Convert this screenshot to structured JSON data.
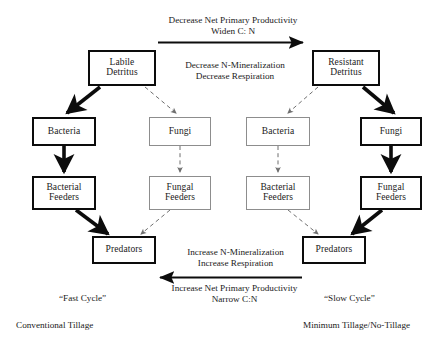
{
  "diagram": {
    "colors": {
      "thick_stroke": "#0c0c0c",
      "thin_stroke": "#8d8d8d",
      "background": "#ffffff",
      "text": "#1a1a1a"
    },
    "nodes": {
      "labile_detritus": "Labile\nDetritus",
      "labile_detritus_l1": "Labile",
      "labile_detritus_l2": "Detritus",
      "resistant_detritus_l1": "Resistant",
      "resistant_detritus_l2": "Detritus",
      "bacteria_left": "Bacteria",
      "fungi_left": "Fungi",
      "bacteria_right": "Bacteria",
      "fungi_right": "Fungi",
      "bacterial_feeders_left_l1": "Bacterial",
      "bacterial_feeders_left_l2": "Feeders",
      "fungal_feeders_left_l1": "Fungal",
      "fungal_feeders_left_l2": "Feeders",
      "bacterial_feeders_right_l1": "Bacterial",
      "bacterial_feeders_right_l2": "Feeders",
      "fungal_feeders_right_l1": "Fungal",
      "fungal_feeders_right_l2": "Feeders",
      "predators_left": "Predators",
      "predators_right": "Predators"
    },
    "labels": {
      "top_arrow_l1": "Decrease Net Primary Productivity",
      "top_arrow_l2": "Widen C: N",
      "middle_l1": "Decrease N-Mineralization",
      "middle_l2": "Decrease Respiration",
      "bottom_mid_l1": "Increase N-Mineralization",
      "bottom_mid_l2": "Increase Respiration",
      "bottom_arrow_l1": "Increase Net Primary Productivity",
      "bottom_arrow_l2": "Narrow C:N",
      "fast_cycle": "“Fast Cycle”",
      "slow_cycle": "“Slow Cycle”",
      "conventional_tillage": "Conventional Tillage",
      "minimum_tillage": "Minimum Tillage/No-Tillage"
    }
  }
}
